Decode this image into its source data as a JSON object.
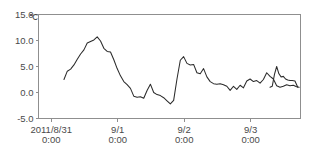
{
  "chart_data": {
    "type": "line",
    "title": "",
    "xlabel": "",
    "ylabel": "",
    "unit_label": "℃",
    "ylim": [
      -5.0,
      15.0
    ],
    "yticks": [
      15.0,
      10.0,
      5.0,
      0.0,
      -5.0
    ],
    "ytick_labels": [
      "15.0",
      "10.0",
      "5.0",
      "0.0",
      "-5.0"
    ],
    "grid": false,
    "legend": "none",
    "xticks": [
      0,
      24,
      48,
      72
    ],
    "xtick_labels": [
      {
        "line1": "2011/8/31",
        "line2": "0:00"
      },
      {
        "line1": "9/1",
        "line2": "0:00"
      },
      {
        "line1": "9/2",
        "line2": "0:00"
      },
      {
        "line1": "9/3",
        "line2": "0:00"
      }
    ],
    "xlim": [
      -4.6,
      90.0
    ],
    "series": [
      {
        "name": "temperature",
        "color": "#2b2b2b",
        "x": [
          4.6,
          5.8,
          7.0,
          8.2,
          9.4,
          10.6,
          11.8,
          13.0,
          14.2,
          15.4,
          16.6,
          17.8,
          19.0,
          20.2,
          21.4,
          22.6,
          23.8,
          25.0,
          26.2,
          27.4,
          28.6,
          29.8,
          31.0,
          32.2,
          33.4,
          34.6,
          35.8,
          37.0,
          38.2,
          39.4,
          40.6,
          41.8,
          43.0,
          44.2,
          45.4,
          46.6,
          47.8,
          49.0,
          50.2,
          51.4,
          52.6,
          53.8,
          55.0,
          56.2,
          57.4,
          58.6,
          59.8,
          61.0,
          62.2,
          63.4,
          64.6,
          65.8,
          67.0,
          68.2,
          69.4,
          70.6,
          71.8,
          73.0,
          74.2,
          75.4,
          76.6,
          77.8,
          79.0,
          80.2,
          81.4,
          82.6,
          83.8,
          85.0,
          86.2,
          87.4,
          88.6,
          89.5
        ],
        "y": [
          2.5,
          4.1,
          4.5,
          5.3,
          6.4,
          7.4,
          8.2,
          9.5,
          9.8,
          10.1,
          10.7,
          9.9,
          8.5,
          7.9,
          7.8,
          6.3,
          4.6,
          3.2,
          2.1,
          1.5,
          0.8,
          -0.7,
          -0.9,
          -0.8,
          -1.1,
          0.4,
          1.6,
          0.0,
          -0.4,
          -0.6,
          -1.0,
          -1.6,
          -2.2,
          -1.5,
          2.6,
          6.2,
          6.9,
          5.6,
          5.3,
          5.4,
          3.8,
          3.6,
          4.6,
          3.0,
          2.1,
          1.7,
          1.6,
          1.7,
          1.5,
          1.2,
          0.4,
          1.2,
          0.6,
          1.4,
          0.9,
          2.2,
          2.6,
          2.1,
          2.3,
          1.8,
          2.5,
          3.8,
          3.1,
          2.6,
          1.3,
          1.0,
          1.2,
          1.5,
          1.3,
          1.4,
          1.1,
          1.0
        ]
      }
    ],
    "series2_x": [
      79.0,
      79.8,
      80.6,
      81.4,
      82.2,
      83.0,
      83.8,
      84.6,
      85.4,
      86.2,
      87.0,
      88.0,
      89.0
    ],
    "series2_y": [
      1.0,
      1.2,
      3.5,
      5.0,
      3.6,
      3.0,
      3.1,
      2.6,
      2.4,
      2.3,
      2.3,
      2.2,
      1.0
    ]
  }
}
